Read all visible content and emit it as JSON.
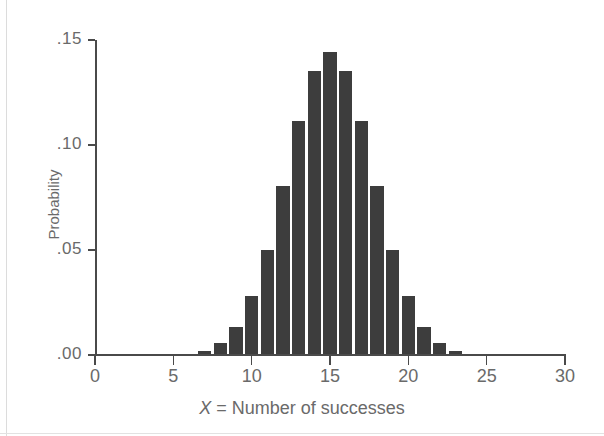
{
  "figure": {
    "background_color": "#ffffff",
    "bar_color": "#3d3d3d",
    "axis_color": "#4a4a4a",
    "text_color": "#6a6a6a"
  },
  "chart_data": {
    "type": "bar",
    "title": "",
    "subtitle": "",
    "xlabel": "X = Number of successes",
    "xlabel_italic_part": "X",
    "xlabel_rest": " = Number of successes",
    "ylabel": "Probability",
    "xlim": [
      0,
      30
    ],
    "ylim": [
      0.0,
      0.15
    ],
    "xticks": [
      0,
      5,
      10,
      15,
      20,
      25,
      30
    ],
    "xticklabels": [
      "0",
      "5",
      "10",
      "15",
      "20",
      "25",
      "30"
    ],
    "yticks": [
      0.0,
      0.05,
      0.1,
      0.15
    ],
    "yticklabels": [
      ".00",
      ".05",
      ".10",
      ".15"
    ],
    "grid": false,
    "legend": null,
    "legend_position": "none",
    "bar_width_units": 1,
    "categories": [
      5,
      6,
      7,
      8,
      9,
      10,
      11,
      12,
      13,
      14,
      15,
      16,
      17,
      18,
      19,
      20,
      21,
      22,
      23,
      24,
      25
    ],
    "values": [
      0.0002,
      0.0006,
      0.0019,
      0.0055,
      0.0133,
      0.028,
      0.05,
      0.0806,
      0.1115,
      0.1354,
      0.1445,
      0.1354,
      0.1115,
      0.0806,
      0.05,
      0.028,
      0.0133,
      0.0055,
      0.0019,
      0.0006,
      0.0002
    ],
    "annotations": []
  }
}
